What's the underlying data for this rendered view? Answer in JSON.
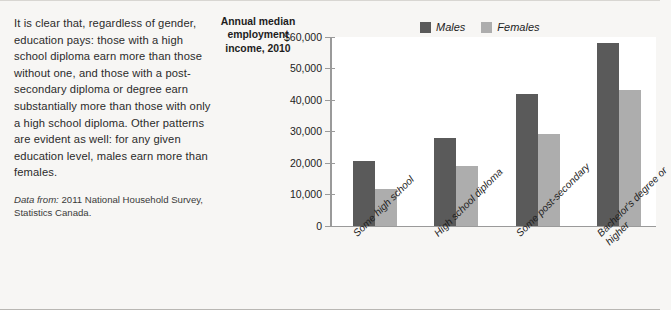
{
  "caption": {
    "body": "It is clear that, regardless of gender, education pays: those with a high school diploma earn more than those without one, and those with a post-secondary diploma or degree earn substantially more than those with only a high school diploma. Other patterns are evident as well: for any given education level, males earn more than females.",
    "source_label": "Data from:",
    "source_text": " 2011 National Household Survey, Statistics Canada."
  },
  "colors": {
    "males": "#5a5a5a",
    "females": "#adadad",
    "axis": "#9a9a9a",
    "plot_background": "#ffffff",
    "page_background": "#f7f6f4"
  },
  "chart_data": {
    "type": "bar",
    "title": "Annual median employment income, 2010",
    "xlabel": "",
    "ylabel": "Annual median employment income, 2010",
    "ylim": [
      0,
      60000
    ],
    "grid": false,
    "legend_position": "top-right",
    "ytick_labels": [
      "$60,000",
      "50,000",
      "40,000",
      "30,000",
      "20,000",
      "10,000",
      "0"
    ],
    "yticks": [
      60000,
      50000,
      40000,
      30000,
      20000,
      10000,
      0
    ],
    "categories": [
      "Some high school",
      "High school diploma",
      "Some post-secondary",
      "Bachelor's degree or\nhigher"
    ],
    "series": [
      {
        "name": "Males",
        "values": [
          20500,
          27800,
          41800,
          58000
        ]
      },
      {
        "name": "Females",
        "values": [
          11500,
          18800,
          29000,
          43000
        ]
      }
    ]
  }
}
